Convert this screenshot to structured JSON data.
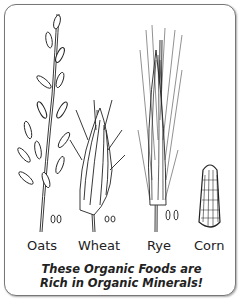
{
  "grains": [
    {
      "name": "Oats"
    },
    {
      "name": "Wheat"
    },
    {
      "name": "Rye"
    },
    {
      "name": "Corn"
    }
  ],
  "caption": {
    "line1": "These Organic Foods are",
    "line2": "Rich in Organic Minerals!"
  }
}
